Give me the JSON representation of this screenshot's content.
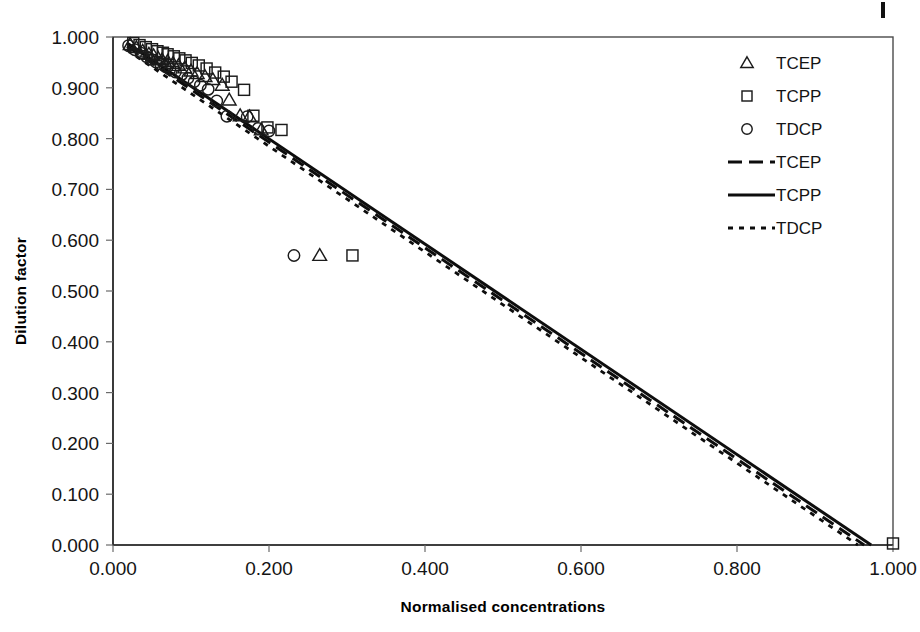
{
  "chart_data": {
    "type": "scatter",
    "title": "",
    "xlabel": "Normalised concentrations",
    "ylabel": "Dilution factor",
    "xlim": [
      0.0,
      1.0
    ],
    "ylim": [
      0.0,
      1.0
    ],
    "xticks": [
      "0.000",
      "0.200",
      "0.400",
      "0.600",
      "0.800",
      "1.000"
    ],
    "xtick_values": [
      0.0,
      0.2,
      0.4,
      0.6,
      0.8,
      1.0
    ],
    "yticks": [
      "0.000",
      "0.100",
      "0.200",
      "0.300",
      "0.400",
      "0.500",
      "0.600",
      "0.700",
      "0.800",
      "0.900",
      "1.000"
    ],
    "ytick_values": [
      0.0,
      0.1,
      0.2,
      0.3,
      0.4,
      0.5,
      0.6,
      0.7,
      0.8,
      0.9,
      1.0
    ],
    "grid": false,
    "legend_position": "top-right",
    "legend": [
      {
        "label": "TCEP",
        "kind": "marker",
        "marker": "triangle"
      },
      {
        "label": "TCPP",
        "kind": "marker",
        "marker": "square"
      },
      {
        "label": "TDCP",
        "kind": "marker",
        "marker": "circle"
      },
      {
        "label": "TCEP",
        "kind": "line",
        "style": "dashed"
      },
      {
        "label": "TCPP",
        "kind": "line",
        "style": "solid"
      },
      {
        "label": "TDCP",
        "kind": "line",
        "style": "dotted"
      }
    ],
    "series": [
      {
        "name": "TCEP",
        "marker": "triangle",
        "points": [
          [
            0.022,
            0.985
          ],
          [
            0.03,
            0.979
          ],
          [
            0.038,
            0.972
          ],
          [
            0.046,
            0.966
          ],
          [
            0.052,
            0.963
          ],
          [
            0.058,
            0.958
          ],
          [
            0.063,
            0.955
          ],
          [
            0.07,
            0.952
          ],
          [
            0.077,
            0.948
          ],
          [
            0.084,
            0.944
          ],
          [
            0.092,
            0.939
          ],
          [
            0.1,
            0.933
          ],
          [
            0.108,
            0.928
          ],
          [
            0.118,
            0.922
          ],
          [
            0.128,
            0.916
          ],
          [
            0.14,
            0.905
          ],
          [
            0.149,
            0.876
          ],
          [
            0.163,
            0.845
          ],
          [
            0.175,
            0.843
          ],
          [
            0.19,
            0.817
          ],
          [
            0.265,
            0.57
          ]
        ]
      },
      {
        "name": "TCPP",
        "marker": "square",
        "points": [
          [
            0.026,
            0.988
          ],
          [
            0.034,
            0.984
          ],
          [
            0.042,
            0.98
          ],
          [
            0.05,
            0.976
          ],
          [
            0.057,
            0.972
          ],
          [
            0.064,
            0.969
          ],
          [
            0.07,
            0.966
          ],
          [
            0.078,
            0.962
          ],
          [
            0.085,
            0.958
          ],
          [
            0.093,
            0.954
          ],
          [
            0.101,
            0.949
          ],
          [
            0.11,
            0.944
          ],
          [
            0.12,
            0.938
          ],
          [
            0.131,
            0.93
          ],
          [
            0.142,
            0.922
          ],
          [
            0.152,
            0.912
          ],
          [
            0.168,
            0.896
          ],
          [
            0.18,
            0.845
          ],
          [
            0.198,
            0.822
          ],
          [
            0.216,
            0.817
          ],
          [
            0.307,
            0.57
          ],
          [
            1.0,
            0.003
          ]
        ]
      },
      {
        "name": "TDCP",
        "marker": "circle",
        "points": [
          [
            0.02,
            0.983
          ],
          [
            0.028,
            0.975
          ],
          [
            0.036,
            0.968
          ],
          [
            0.043,
            0.961
          ],
          [
            0.049,
            0.956
          ],
          [
            0.055,
            0.951
          ],
          [
            0.061,
            0.947
          ],
          [
            0.067,
            0.942
          ],
          [
            0.073,
            0.937
          ],
          [
            0.08,
            0.931
          ],
          [
            0.088,
            0.926
          ],
          [
            0.096,
            0.919
          ],
          [
            0.104,
            0.912
          ],
          [
            0.112,
            0.905
          ],
          [
            0.122,
            0.897
          ],
          [
            0.133,
            0.874
          ],
          [
            0.146,
            0.844
          ],
          [
            0.172,
            0.843
          ],
          [
            0.186,
            0.82
          ],
          [
            0.2,
            0.815
          ],
          [
            0.232,
            0.57
          ]
        ]
      }
    ],
    "trendlines": [
      {
        "name": "TCPP",
        "style": "solid",
        "x0": 0.018,
        "y0": 0.988,
        "x1": 0.972,
        "y1": 0.0
      },
      {
        "name": "TCEP",
        "style": "dashed",
        "x0": 0.018,
        "y0": 0.982,
        "x1": 0.963,
        "y1": 0.0
      },
      {
        "name": "TDCP",
        "style": "dotted",
        "x0": 0.018,
        "y0": 0.974,
        "x1": 0.955,
        "y1": 0.0
      }
    ]
  }
}
